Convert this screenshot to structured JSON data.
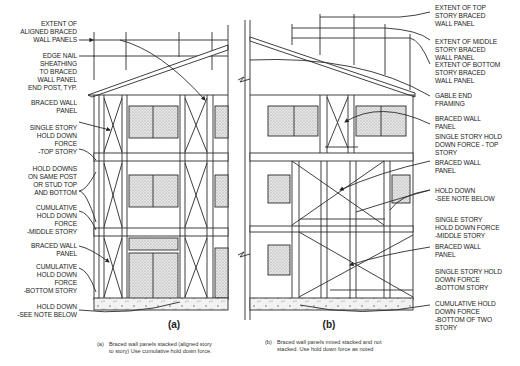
{
  "figure": {
    "panel_a": {
      "tag": "(a)",
      "labels": [
        {
          "id": "extent-aligned",
          "text": "EXTENT OF\nALIGNED BRACED\nWALL PANELS"
        },
        {
          "id": "edge-nail",
          "text": "EDGE NAIL\nSHEATHING\nTO BRACED\nWALL PANEL\nEND POST, TYP."
        },
        {
          "id": "braced-wall-top",
          "text": "BRACED WALL\nPANEL"
        },
        {
          "id": "single-story-top",
          "text": "SINGLE STORY\nHOLD DOWN\nFORCE\n-TOP STORY"
        },
        {
          "id": "hold-downs-same-post",
          "text": "HOLD DOWNS\nON SAME POST\nOR STUD TOP\nAND BOTTOM"
        },
        {
          "id": "cumulative-middle",
          "text": "CUMULATIVE\nHOLD DOWN\nFORCE\n-MIDDLE STORY"
        },
        {
          "id": "braced-wall-bottom",
          "text": "BRACED WALL\nPANEL"
        },
        {
          "id": "cumulative-bottom",
          "text": "CUMULATIVE\nHOLD DOWN\nFORCE\n-BOTTOM STORY"
        },
        {
          "id": "hold-down-note",
          "text": "HOLD DOWN\n-SEE NOTE BELOW"
        }
      ],
      "caption_key": "(a)",
      "caption": "Braced wall panels stacked (aligned story\nto story) Use cumulative hold down force."
    },
    "panel_b": {
      "tag": "(b)",
      "labels": [
        {
          "id": "extent-top",
          "text": "EXTENT OF TOP\nSTORY BRACED\nWALL PANEL"
        },
        {
          "id": "extent-middle",
          "text": "EXTENT OF MIDDLE\nSTORY BRACED\nWALL PANEL"
        },
        {
          "id": "extent-bottom",
          "text": "EXTENT OF BOTTOM\nSTORY BRACED\nWALL PANEL"
        },
        {
          "id": "gable-end",
          "text": "GABLE END\nFRAMING"
        },
        {
          "id": "braced-wall-1",
          "text": "BRACED WALL\nPANEL"
        },
        {
          "id": "single-story-top",
          "text": "SINGLE STORY HOLD\nDOWN FORCE - TOP\nSTORY"
        },
        {
          "id": "braced-wall-2",
          "text": "BRACED WALL\nPANEL"
        },
        {
          "id": "hold-down-note",
          "text": "HOLD DOWN\n-SEE NOTE BELOW"
        },
        {
          "id": "single-story-middle",
          "text": "SINGLE STORY\nHOLD DOWN FORCE\n-MIDDLE STORY"
        },
        {
          "id": "braced-wall-3",
          "text": "BRACED WALL\nPANEL"
        },
        {
          "id": "single-story-bottom",
          "text": "SINGLE STORY HOLD\nDOWN FORCE\n-BOTTOM STORY"
        },
        {
          "id": "cumulative-bottom-two",
          "text": "CUMULATIVE HOLD\nDOWN FORCE\n-BOTTOM OF TWO\nSTORY"
        }
      ],
      "caption_key": "(b)",
      "caption": "Braced wall panels mixed stacked and not\nstacked. Use hold down force as noted"
    },
    "colors": {
      "line": "#2a2a2a",
      "hatch": "#c8c8c8",
      "background": "#ffffff"
    }
  }
}
